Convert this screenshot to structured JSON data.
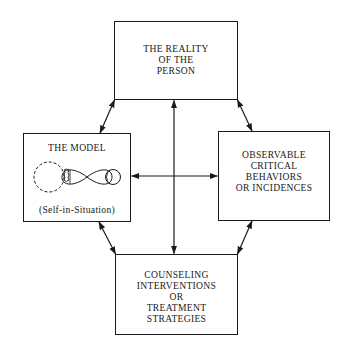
{
  "diagram": {
    "nodes": {
      "top": {
        "lines": [
          "THE REALITY",
          "OF THE",
          "PERSON"
        ]
      },
      "left": {
        "title": "THE MODEL",
        "caption": "(Self-in-Situation)"
      },
      "right": {
        "lines": [
          "OBSERVABLE",
          "CRITICAL",
          "BEHAVIORS",
          "OR INCIDENCES"
        ]
      },
      "bottom": {
        "lines": [
          "COUNSELING",
          "INTERVENTIONS",
          "OR",
          "TREATMENT",
          "STRATEGIES"
        ]
      }
    },
    "edges": [
      {
        "from": "top",
        "to": "left",
        "direction": "bidirectional"
      },
      {
        "from": "top",
        "to": "right",
        "direction": "bidirectional"
      },
      {
        "from": "left",
        "to": "bottom",
        "direction": "bidirectional"
      },
      {
        "from": "right",
        "to": "bottom",
        "direction": "bidirectional"
      },
      {
        "from": "center",
        "to": "top",
        "direction": "one-way"
      },
      {
        "from": "center",
        "to": "bottom",
        "direction": "one-way"
      },
      {
        "from": "center",
        "to": "left",
        "direction": "one-way"
      },
      {
        "from": "center",
        "to": "right",
        "direction": "one-way"
      }
    ],
    "colors": {
      "ink": "#1a1a1a",
      "background": "#ffffff"
    }
  }
}
